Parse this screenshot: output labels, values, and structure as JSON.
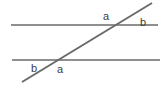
{
  "diagram": {
    "type": "geometry",
    "canvas": {
      "width": 165,
      "height": 85
    },
    "background_color": "#ffffff",
    "line_color": "#6a6a6a",
    "text_color": "#3c3c3c",
    "line_width": 1.6,
    "transversal_width": 2.0,
    "lines": [
      {
        "name": "upper-parallel-line",
        "x1": 11,
        "y1": 25,
        "x2": 158,
        "y2": 25
      },
      {
        "name": "lower-parallel-line",
        "x1": 12,
        "y1": 60,
        "x2": 160,
        "y2": 60
      },
      {
        "name": "transversal-line",
        "x1": 22,
        "y1": 82,
        "x2": 152,
        "y2": 3
      }
    ],
    "intersections": [
      {
        "name": "upper-intersection",
        "x": 114,
        "y": 25
      },
      {
        "name": "lower-intersection",
        "x": 52,
        "y": 60
      }
    ],
    "labels": [
      {
        "name": "upper-left-angle",
        "text": "a",
        "x": 103,
        "y": 11
      },
      {
        "name": "upper-right-angle",
        "text": "b",
        "x": 140,
        "y": 17
      },
      {
        "name": "lower-left-angle",
        "text": "b",
        "x": 31,
        "y": 63
      },
      {
        "name": "lower-right-angle",
        "text": "a",
        "x": 57,
        "y": 64
      }
    ]
  }
}
